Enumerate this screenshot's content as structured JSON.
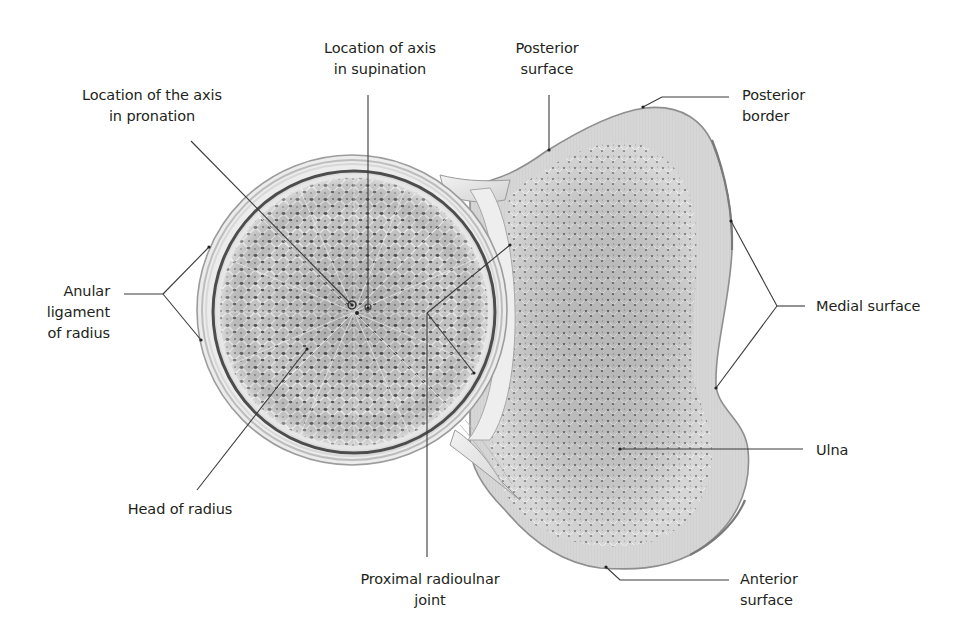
{
  "figure": {
    "colors": {
      "background": "#ffffff",
      "text": "#231f20",
      "leader": "#3a3a3a",
      "bone_cortex": "#d9d9d9",
      "bone_cortex_edge": "#8a8a8a",
      "spongy_bone": "#bdbdbd",
      "spongy_pore": "#4a4a4a",
      "ligament": "#e6e6e6"
    }
  },
  "labels": [
    {
      "id": "axis-supination",
      "lines": [
        "Location of axis",
        "in supination"
      ],
      "x": 300,
      "y": 38,
      "w": 160,
      "align": "center"
    },
    {
      "id": "axis-pronation",
      "lines": [
        "Location of the axis",
        "in pronation"
      ],
      "x": 62,
      "y": 85,
      "w": 180,
      "align": "center"
    },
    {
      "id": "posterior-surface",
      "lines": [
        "Posterior",
        "surface"
      ],
      "x": 502,
      "y": 38,
      "w": 90,
      "align": "center"
    },
    {
      "id": "posterior-border",
      "lines": [
        "Posterior",
        "border"
      ],
      "x": 742,
      "y": 85,
      "w": 90,
      "align": "left"
    },
    {
      "id": "anular-ligament",
      "lines": [
        "Anular",
        "ligament",
        "of radius"
      ],
      "x": 30,
      "y": 281,
      "w": 80,
      "align": "right"
    },
    {
      "id": "medial-surface",
      "lines": [
        "Medial surface"
      ],
      "x": 816,
      "y": 296,
      "w": 140,
      "align": "left"
    },
    {
      "id": "ulna",
      "lines": [
        "Ulna"
      ],
      "x": 816,
      "y": 440,
      "w": 60,
      "align": "left"
    },
    {
      "id": "head-of-radius",
      "lines": [
        "Head of radius"
      ],
      "x": 110,
      "y": 499,
      "w": 140,
      "align": "center"
    },
    {
      "id": "proximal-radioulnar-joint",
      "lines": [
        "Proximal radioulnar",
        "joint"
      ],
      "x": 335,
      "y": 569,
      "w": 190,
      "align": "center"
    },
    {
      "id": "anterior-surface",
      "lines": [
        "Anterior",
        "surface"
      ],
      "x": 740,
      "y": 569,
      "w": 90,
      "align": "left"
    }
  ],
  "leaders": [
    {
      "id": "axis-supination",
      "points": [
        [
          368,
          95
        ],
        [
          368,
          308
        ]
      ]
    },
    {
      "id": "axis-pronation",
      "points": [
        [
          191,
          141
        ],
        [
          352,
          305
        ]
      ]
    },
    {
      "id": "posterior-surface",
      "points": [
        [
          549,
          95
        ],
        [
          549,
          150
        ]
      ]
    },
    {
      "id": "posterior-border",
      "points": [
        [
          729,
          97
        ],
        [
          662,
          97
        ],
        [
          643,
          107
        ]
      ]
    },
    {
      "id": "anular-left-stem",
      "points": [
        [
          124,
          294
        ],
        [
          163,
          294
        ]
      ]
    },
    {
      "id": "anular-upper",
      "points": [
        [
          163,
          294
        ],
        [
          209,
          247
        ]
      ]
    },
    {
      "id": "anular-lower",
      "points": [
        [
          163,
          294
        ],
        [
          201,
          340
        ]
      ]
    },
    {
      "id": "medial-stem",
      "points": [
        [
          805,
          306
        ],
        [
          777,
          306
        ]
      ]
    },
    {
      "id": "medial-upper",
      "points": [
        [
          777,
          306
        ],
        [
          731,
          221
        ]
      ]
    },
    {
      "id": "medial-lower",
      "points": [
        [
          777,
          306
        ],
        [
          716,
          388
        ]
      ]
    },
    {
      "id": "ulna",
      "points": [
        [
          803,
          449
        ],
        [
          620,
          449
        ]
      ]
    },
    {
      "id": "head-of-radius",
      "points": [
        [
          197,
          490
        ],
        [
          307,
          349
        ]
      ]
    },
    {
      "id": "joint-stem",
      "points": [
        [
          427,
          557
        ],
        [
          427,
          313
        ]
      ]
    },
    {
      "id": "joint-upper",
      "points": [
        [
          427,
          313
        ],
        [
          510,
          245
        ]
      ]
    },
    {
      "id": "joint-lower",
      "points": [
        [
          427,
          313
        ],
        [
          474,
          373
        ]
      ]
    },
    {
      "id": "anterior-surface",
      "points": [
        [
          729,
          580
        ],
        [
          620,
          580
        ],
        [
          606,
          567
        ]
      ]
    }
  ],
  "endpoints": [
    [
      368,
      308
    ],
    [
      352,
      305
    ],
    [
      549,
      150
    ],
    [
      643,
      107
    ],
    [
      209,
      247
    ],
    [
      201,
      340
    ],
    [
      731,
      221
    ],
    [
      716,
      388
    ],
    [
      620,
      449
    ],
    [
      307,
      349
    ],
    [
      510,
      245
    ],
    [
      474,
      373
    ],
    [
      606,
      567
    ]
  ],
  "radius_head": {
    "cx": 352,
    "cy": 310,
    "r_outer_ligament": 165,
    "r_cortex": 148,
    "r_spongy": 136
  },
  "axis_points": {
    "pronation": [
      352,
      305
    ],
    "supination": [
      368,
      307
    ]
  }
}
